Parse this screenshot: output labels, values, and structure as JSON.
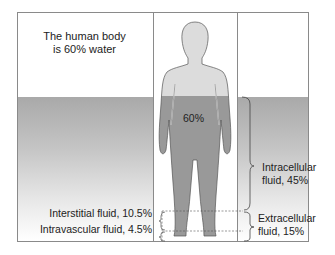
{
  "diagram": {
    "title_line1": "The human body",
    "title_line2": "is 60% water",
    "body_percent": "60%",
    "labels": {
      "interstitial": "Interstitial fluid, 10.5%",
      "intravascular": "Intravascular fluid, 4.5%",
      "intracellular_line1": "Intracellular",
      "intracellular_line2": "fluid, 45%",
      "extracellular_line1": "Extracellular",
      "extracellular_line2": "fluid, 15%"
    },
    "colors": {
      "water_band_top": "#a9a9a9",
      "figure_upper": "#d9d9d9",
      "figure_lower": "#9a9a9a",
      "frame": "#8a8a8a"
    }
  }
}
